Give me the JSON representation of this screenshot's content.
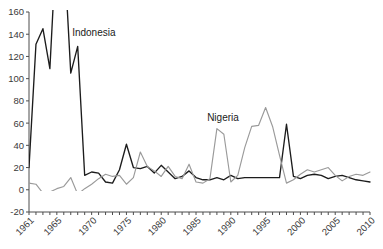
{
  "chart_data": {
    "type": "line",
    "title": "",
    "xlabel": "",
    "ylabel": "",
    "ylim": [
      -20,
      160
    ],
    "xlim": [
      1961,
      2010
    ],
    "yticks": [
      -20,
      0,
      20,
      40,
      60,
      80,
      100,
      120,
      140,
      160
    ],
    "ytick_labels": [
      "-20",
      "0",
      "20",
      "40",
      "60",
      "80",
      "100",
      "120",
      "140",
      "160"
    ],
    "xticks": [
      1961,
      1965,
      1970,
      1975,
      1980,
      1985,
      1990,
      1995,
      2000,
      2005,
      2010
    ],
    "xtick_labels": [
      "1961",
      "1965",
      "1970",
      "1975",
      "1980",
      "1985",
      "1990",
      "1995",
      "2000",
      "2005",
      "2010"
    ],
    "grid": false,
    "legend_position": "inline-annotation",
    "x": [
      1961,
      1962,
      1963,
      1964,
      1965,
      1966,
      1967,
      1968,
      1969,
      1970,
      1971,
      1972,
      1973,
      1974,
      1975,
      1976,
      1977,
      1978,
      1979,
      1980,
      1981,
      1982,
      1983,
      1984,
      1985,
      1986,
      1987,
      1988,
      1989,
      1990,
      1991,
      1992,
      1993,
      1994,
      1995,
      1996,
      1997,
      1998,
      1999,
      2000,
      2001,
      2002,
      2003,
      2004,
      2005,
      2006,
      2007,
      2008,
      2009,
      2010
    ],
    "series": [
      {
        "name": "Indonesia",
        "color": "#1c1c1c",
        "style": "solid",
        "annotation": {
          "label": "Indonesia",
          "x": 1967.2,
          "y": 138
        },
        "clipped_above": 160,
        "values": [
          20,
          131,
          145,
          109,
          230,
          220,
          105,
          129,
          13,
          16,
          15,
          7,
          6,
          18,
          41,
          20,
          19,
          21,
          15,
          22,
          16,
          10,
          12,
          17,
          11,
          9,
          9,
          11,
          9,
          13,
          10,
          11,
          11,
          11,
          11,
          11,
          11,
          59,
          12,
          10,
          13,
          14,
          13,
          10,
          12,
          13,
          11,
          9,
          8,
          7
        ]
      },
      {
        "name": "Nigeria",
        "color": "#9a9a9a",
        "style": "solid",
        "annotation": {
          "label": "Nigeria",
          "x": 1986.6,
          "y": 62
        },
        "clipped_above": 160,
        "values": [
          6,
          5,
          -3,
          -2,
          1,
          3,
          11,
          -4,
          1,
          5,
          10,
          14,
          12,
          13,
          5,
          11,
          34,
          21,
          17,
          12,
          21,
          12,
          10,
          23,
          7,
          6,
          10,
          55,
          50,
          7,
          13,
          38,
          57,
          58,
          74,
          57,
          31,
          6,
          9,
          14,
          18,
          16,
          18,
          20,
          13,
          8,
          12,
          14,
          13,
          16
        ]
      }
    ]
  }
}
